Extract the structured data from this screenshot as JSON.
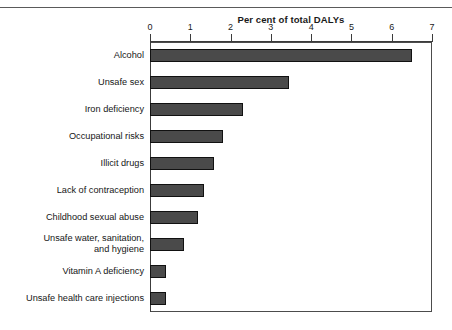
{
  "chart_data": {
    "type": "bar",
    "orientation": "horizontal",
    "title": "Per cent of total DALYs",
    "xlabel": "Per cent of total DALYs",
    "ylabel": "",
    "xlim": [
      0,
      7
    ],
    "xticks": [
      0,
      1,
      2,
      3,
      4,
      5,
      6,
      7
    ],
    "xtick_labels": [
      "0",
      "1",
      "2",
      "3",
      "4",
      "5",
      "6",
      "7"
    ],
    "grid": false,
    "legend": null,
    "bar_color": "#4a4a4a",
    "bar_edge_color": "#111111",
    "categories": [
      "Alcohol",
      "Unsafe sex",
      "Iron deficiency",
      "Occupational risks",
      "Illicit drugs",
      "Lack of contraception",
      "Childhood sexual abuse",
      "Unsafe water, sanitation,\nand hygiene",
      "Vitamin A deficiency",
      "Unsafe health care injections"
    ],
    "values": [
      6.5,
      3.45,
      2.3,
      1.8,
      1.6,
      1.35,
      1.2,
      0.85,
      0.4,
      0.4
    ]
  }
}
